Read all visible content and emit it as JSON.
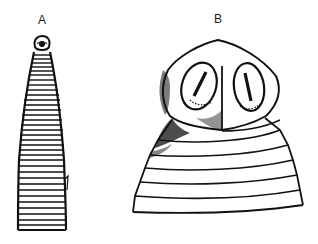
{
  "figure": {
    "panels": [
      {
        "label": "A",
        "description": "Elongated tapering segmented body with small rounded head at tip",
        "segment_count": 36
      },
      {
        "label": "B",
        "description": "Enlarged head (scolex) with two oval suckers and a median groove atop a segmented neck",
        "segment_count": 7
      }
    ],
    "colors": {
      "ink": "#111111",
      "paper": "#ffffff"
    }
  }
}
